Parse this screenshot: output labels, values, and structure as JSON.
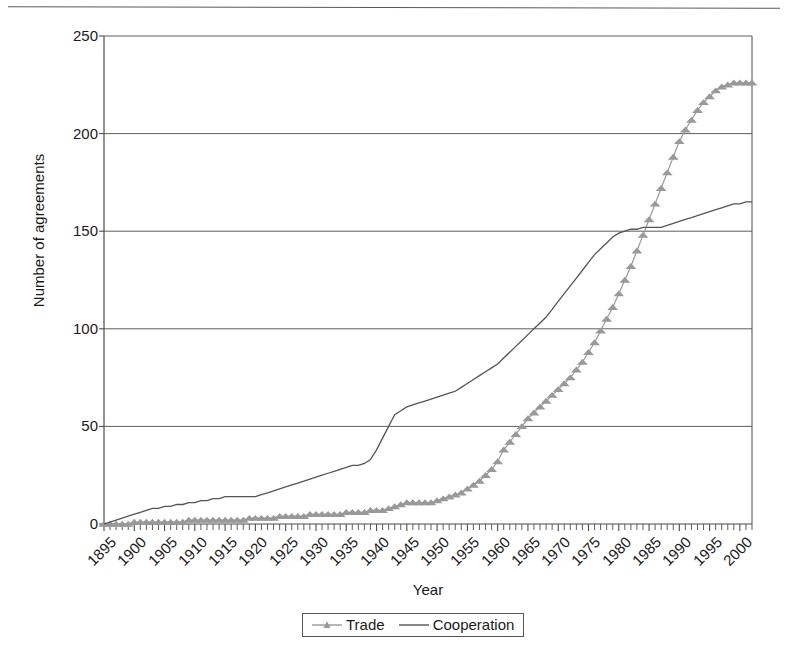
{
  "chart_data": {
    "type": "line",
    "title": "",
    "xlabel": "Year",
    "ylabel": "Number of agreements",
    "xlim": [
      1895,
      2002
    ],
    "ylim": [
      0,
      250
    ],
    "yticks": [
      0,
      50,
      100,
      150,
      200,
      250
    ],
    "xticks": [
      1895,
      1900,
      1905,
      1910,
      1915,
      1920,
      1925,
      1930,
      1935,
      1940,
      1945,
      1950,
      1955,
      1960,
      1965,
      1970,
      1975,
      1980,
      1985,
      1990,
      1995,
      2000
    ],
    "grid": "horizontal",
    "legend_position": "bottom",
    "x": [
      1895,
      1896,
      1897,
      1898,
      1899,
      1900,
      1901,
      1902,
      1903,
      1904,
      1905,
      1906,
      1907,
      1908,
      1909,
      1910,
      1911,
      1912,
      1913,
      1914,
      1915,
      1916,
      1917,
      1918,
      1919,
      1920,
      1921,
      1922,
      1923,
      1924,
      1925,
      1926,
      1927,
      1928,
      1929,
      1930,
      1931,
      1932,
      1933,
      1934,
      1935,
      1936,
      1937,
      1938,
      1939,
      1940,
      1941,
      1942,
      1943,
      1944,
      1945,
      1946,
      1947,
      1948,
      1949,
      1950,
      1951,
      1952,
      1953,
      1954,
      1955,
      1956,
      1957,
      1958,
      1959,
      1960,
      1961,
      1962,
      1963,
      1964,
      1965,
      1966,
      1967,
      1968,
      1969,
      1970,
      1971,
      1972,
      1973,
      1974,
      1975,
      1976,
      1977,
      1978,
      1979,
      1980,
      1981,
      1982,
      1983,
      1984,
      1985,
      1986,
      1987,
      1988,
      1989,
      1990,
      1991,
      1992,
      1993,
      1994,
      1995,
      1996,
      1997,
      1998,
      1999,
      2000,
      2001,
      2002
    ],
    "series": [
      {
        "name": "Trade",
        "color": "#999999",
        "marker": "triangle",
        "values": [
          0,
          0,
          0,
          0,
          0,
          1,
          1,
          1,
          1,
          1,
          1,
          1,
          1,
          1,
          2,
          2,
          2,
          2,
          2,
          2,
          2,
          2,
          2,
          2,
          3,
          3,
          3,
          3,
          3,
          4,
          4,
          4,
          4,
          4,
          5,
          5,
          5,
          5,
          5,
          5,
          6,
          6,
          6,
          6,
          7,
          7,
          7,
          8,
          9,
          10,
          11,
          11,
          11,
          11,
          11,
          12,
          13,
          14,
          15,
          16,
          18,
          20,
          22,
          25,
          28,
          32,
          38,
          42,
          46,
          50,
          54,
          57,
          60,
          63,
          66,
          69,
          72,
          75,
          79,
          83,
          88,
          93,
          99,
          105,
          111,
          118,
          125,
          132,
          140,
          148,
          156,
          164,
          172,
          180,
          188,
          196,
          202,
          207,
          212,
          216,
          219,
          222,
          224,
          225,
          226,
          226,
          226,
          226
        ]
      },
      {
        "name": "Cooperation",
        "color": "#555555",
        "marker": "none",
        "values": [
          0,
          1,
          2,
          3,
          4,
          5,
          6,
          7,
          8,
          8,
          9,
          9,
          10,
          10,
          11,
          11,
          12,
          12,
          13,
          13,
          14,
          14,
          14,
          14,
          14,
          14,
          15,
          16,
          17,
          18,
          19,
          20,
          21,
          22,
          23,
          24,
          25,
          26,
          27,
          28,
          29,
          30,
          30,
          31,
          33,
          38,
          44,
          50,
          56,
          58,
          60,
          61,
          62,
          63,
          64,
          65,
          66,
          67,
          68,
          70,
          72,
          74,
          76,
          78,
          80,
          82,
          85,
          88,
          91,
          94,
          97,
          100,
          103,
          106,
          110,
          114,
          118,
          122,
          126,
          130,
          134,
          138,
          141,
          144,
          147,
          149,
          150,
          151,
          151,
          152,
          152,
          152,
          152,
          153,
          154,
          155,
          156,
          157,
          158,
          159,
          160,
          161,
          162,
          163,
          164,
          164,
          165,
          165
        ]
      }
    ]
  },
  "axis": {
    "y_title": "Number of agreements",
    "x_title": "Year"
  },
  "legend": {
    "items": [
      {
        "label": "Trade",
        "key": "line-with-triangle-marker"
      },
      {
        "label": "Cooperation",
        "key": "plain-line"
      }
    ]
  }
}
